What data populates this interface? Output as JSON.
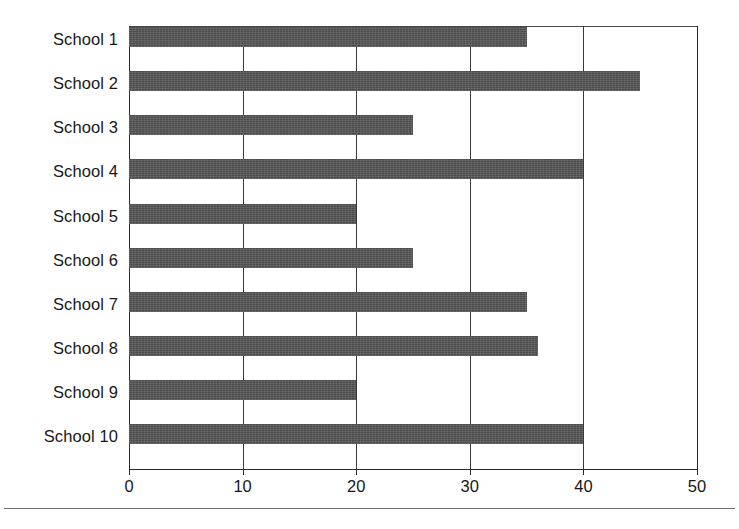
{
  "chart_data": {
    "type": "bar",
    "orientation": "horizontal",
    "title": "",
    "subtitle": "",
    "xlabel": "",
    "ylabel": "",
    "categories": [
      "School 1",
      "School 2",
      "School 3",
      "School 4",
      "School 5",
      "School 6",
      "School 7",
      "School 8",
      "School 9",
      "School 10"
    ],
    "values": [
      35,
      45,
      25,
      40,
      20,
      25,
      35,
      36,
      20,
      40
    ],
    "xlim": [
      0,
      50
    ],
    "xticks": [
      0,
      10,
      20,
      30,
      40,
      50
    ],
    "xtick_labels": [
      "0",
      "10",
      "20",
      "30",
      "40",
      "50"
    ],
    "grid": "vertical",
    "legend": "none",
    "bar_color": "#4c4c4c",
    "axis_color": "#2b2b2b",
    "background_color": "#ffffff"
  }
}
